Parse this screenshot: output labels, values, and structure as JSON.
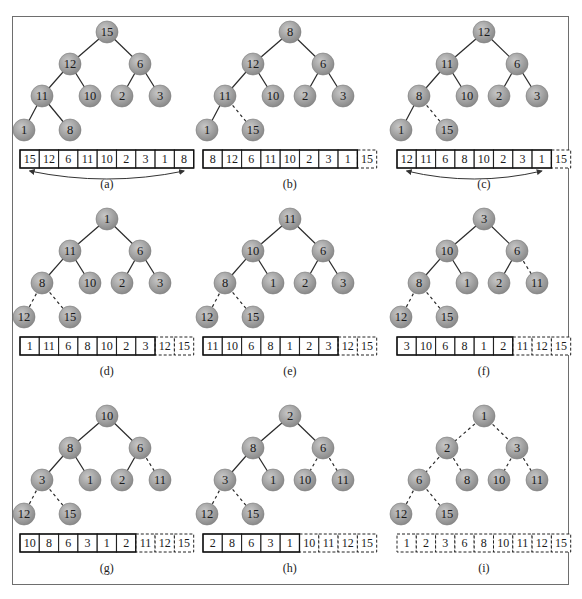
{
  "figure": {
    "colors": {
      "node_fill_light": "#c8c8c8",
      "node_fill_dark": "#8a8a8a",
      "edge": "#2a2a2a",
      "frame": "#6e6e6e"
    },
    "panels": [
      {
        "label": "(a)",
        "nodes": [
          15,
          12,
          6,
          11,
          10,
          2,
          3,
          1,
          8
        ],
        "dashed_edges_to": [],
        "array": [
          15,
          12,
          6,
          11,
          10,
          2,
          3,
          1,
          8
        ],
        "sorted_count": 0,
        "swap_arrow": [
          0,
          8
        ]
      },
      {
        "label": "(b)",
        "nodes": [
          8,
          12,
          6,
          11,
          10,
          2,
          3,
          1,
          15
        ],
        "dashed_edges_to": [
          8
        ],
        "array": [
          8,
          12,
          6,
          11,
          10,
          2,
          3,
          1,
          15
        ],
        "sorted_count": 1,
        "swap_arrow": null
      },
      {
        "label": "(c)",
        "nodes": [
          12,
          11,
          6,
          8,
          10,
          2,
          3,
          1,
          15
        ],
        "dashed_edges_to": [
          8
        ],
        "array": [
          12,
          11,
          6,
          8,
          10,
          2,
          3,
          1,
          15
        ],
        "sorted_count": 1,
        "swap_arrow": [
          0,
          7
        ]
      },
      {
        "label": "(d)",
        "nodes": [
          1,
          11,
          6,
          8,
          10,
          2,
          3,
          12,
          15
        ],
        "dashed_edges_to": [
          7,
          8
        ],
        "array": [
          1,
          11,
          6,
          8,
          10,
          2,
          3,
          12,
          15
        ],
        "sorted_count": 2,
        "swap_arrow": null
      },
      {
        "label": "(e)",
        "nodes": [
          11,
          10,
          6,
          8,
          1,
          2,
          3,
          12,
          15
        ],
        "dashed_edges_to": [
          7,
          8
        ],
        "array": [
          11,
          10,
          6,
          8,
          1,
          2,
          3,
          12,
          15
        ],
        "sorted_count": 2,
        "swap_arrow": null
      },
      {
        "label": "(f)",
        "nodes": [
          3,
          10,
          6,
          8,
          1,
          2,
          11,
          12,
          15
        ],
        "dashed_edges_to": [
          6,
          7,
          8
        ],
        "array": [
          3,
          10,
          6,
          8,
          1,
          2,
          11,
          12,
          15
        ],
        "sorted_count": 3,
        "swap_arrow": null
      },
      {
        "label": "(g)",
        "nodes": [
          10,
          8,
          6,
          3,
          1,
          2,
          11,
          12,
          15
        ],
        "dashed_edges_to": [
          6,
          7,
          8
        ],
        "array": [
          10,
          8,
          6,
          3,
          1,
          2,
          11,
          12,
          15
        ],
        "sorted_count": 3,
        "swap_arrow": null
      },
      {
        "label": "(h)",
        "nodes": [
          2,
          8,
          6,
          3,
          1,
          10,
          11,
          12,
          15
        ],
        "dashed_edges_to": [
          5,
          6,
          7,
          8
        ],
        "array": [
          2,
          8,
          6,
          3,
          1,
          10,
          11,
          12,
          15
        ],
        "sorted_count": 4,
        "swap_arrow": null
      },
      {
        "label": "(i)",
        "nodes": [
          1,
          2,
          3,
          6,
          8,
          10,
          11,
          12,
          15
        ],
        "dashed_edges_to": [
          1,
          2,
          3,
          4,
          5,
          6,
          7,
          8
        ],
        "array": [
          1,
          2,
          3,
          6,
          8,
          10,
          11,
          12,
          15
        ],
        "sorted_count": 9,
        "swap_arrow": null
      }
    ]
  }
}
